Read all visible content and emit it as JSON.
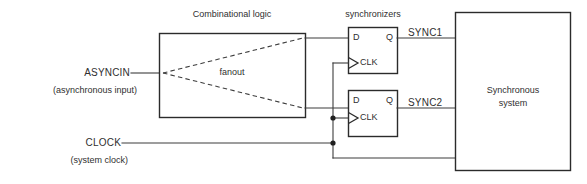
{
  "diagram": {
    "colors": {
      "wire": "#3d3d3d",
      "box_border": "#2b2b2b",
      "text": "#2f2f2f",
      "background": "#ffffff",
      "junction": "#1f1f1f"
    },
    "blocks": {
      "combinational_logic": {
        "caption": "Combinational logic",
        "inner_label": "fanout"
      },
      "synchronizers": {
        "caption": "synchronizers",
        "flipflop1": {
          "d_label": "D",
          "q_label": "Q",
          "clk_label": "CLK"
        },
        "flipflop2": {
          "d_label": "D",
          "q_label": "Q",
          "clk_label": "CLK"
        }
      },
      "synchronous_system": {
        "line1": "Synchronous",
        "line2": "system"
      }
    },
    "signals": {
      "asyncin": {
        "name": "ASYNCIN",
        "note": "(asynchronous input)"
      },
      "clock": {
        "name": "CLOCK",
        "note": "(system clock)"
      },
      "sync1": {
        "name": "SYNC1"
      },
      "sync2": {
        "name": "SYNC2"
      }
    }
  }
}
